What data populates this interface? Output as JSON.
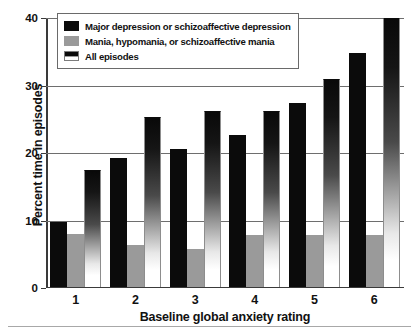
{
  "chart_data": {
    "type": "bar",
    "title": "",
    "xlabel": "Baseline global anxiety rating",
    "ylabel": "Percent time in episodes",
    "categories": [
      "1",
      "2",
      "3",
      "4",
      "5",
      "6"
    ],
    "ylim": [
      0,
      40
    ],
    "yticks": [
      0,
      10,
      20,
      30,
      40
    ],
    "grid": true,
    "legend_position": "top-left",
    "series": [
      {
        "name": "Major depression or schizoaffective depression",
        "color": "#0b0b0b",
        "values": [
          9.5,
          19.0,
          20.3,
          22.5,
          27.2,
          34.6
        ]
      },
      {
        "name": "Mania, hypomania, or schizoaffective mania",
        "color": "#9a9a9a",
        "values": [
          7.8,
          6.2,
          5.6,
          7.7,
          7.7,
          7.6
        ]
      },
      {
        "name": "All episodes",
        "color": "gradient-black-to-white",
        "values": [
          17.3,
          25.1,
          26.0,
          26.0,
          30.7,
          39.8
        ]
      }
    ]
  },
  "legend": {
    "items": [
      {
        "label": "Major depression or schizoaffective depression",
        "swatch": "swatch-solid-black"
      },
      {
        "label": "Mania, hypomania, or schizoaffective mania",
        "swatch": "swatch-solid-gray"
      },
      {
        "label": "All episodes",
        "swatch": "swatch-gradient"
      }
    ]
  }
}
